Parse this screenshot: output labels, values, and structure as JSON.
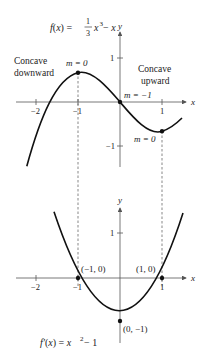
{
  "top_graph": {
    "function_label": {
      "lhs": "f(x) = ",
      "frac_num": "1",
      "frac_den": "3",
      "term1": "x",
      "exp": "3",
      "rest": " − x"
    },
    "axis_x": "x",
    "axis_y": "y",
    "x_ticks": [
      "−2",
      "−1",
      "1"
    ],
    "y_ticks": [
      "1",
      "−1"
    ],
    "annotations": {
      "concave_down_1": "Concave",
      "concave_down_2": "downward",
      "concave_up_1": "Concave",
      "concave_up_2": "upward",
      "slope_max": "m = 0",
      "slope_inflection": "m = −1",
      "slope_min": "m = 0"
    }
  },
  "bottom_graph": {
    "function_label": {
      "lhs": "f′(x) = x",
      "exp": "2",
      "rest": " − 1"
    },
    "axis_x": "x",
    "axis_y": "y",
    "x_ticks": [
      "−2",
      "−1",
      "1"
    ],
    "y_ticks": [
      "1"
    ],
    "points": {
      "left_root": "(−1, 0)",
      "right_root": "(1, 0)",
      "vertex": "(0, −1)"
    }
  },
  "colors": {
    "curve": "#111111",
    "axis": "#555555",
    "text": "#222222"
  }
}
